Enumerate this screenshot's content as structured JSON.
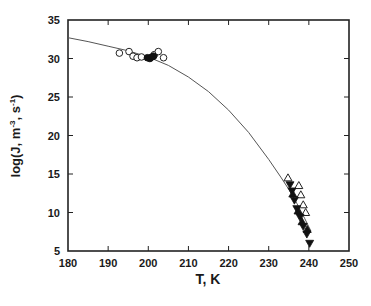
{
  "chart_data": {
    "type": "scatter",
    "title": "",
    "xlabel": "T, K",
    "ylabel": "log(J, m⁻³, s⁻¹)",
    "ylabel_parts": {
      "base": "log(J, m",
      "exp1": "-3",
      "mid": ", s",
      "exp2": "-1",
      "end": ")"
    },
    "xlim": [
      180,
      250
    ],
    "ylim": [
      5,
      35
    ],
    "xticks": [
      180,
      190,
      200,
      210,
      220,
      230,
      240,
      250
    ],
    "yticks": [
      5,
      10,
      15,
      20,
      25,
      30,
      35
    ],
    "grid": false,
    "legend": "none",
    "series": [
      {
        "name": "open circles",
        "marker": "circle-open",
        "points": [
          [
            192.8,
            30.7
          ],
          [
            195.2,
            30.9
          ],
          [
            196.2,
            30.3
          ],
          [
            197.2,
            30.1
          ],
          [
            198.3,
            30.2
          ],
          [
            201.5,
            30.5
          ],
          [
            202.5,
            30.9
          ],
          [
            203.8,
            30.1
          ]
        ]
      },
      {
        "name": "filled circles",
        "marker": "circle-filled",
        "points": [
          [
            199.8,
            30.1
          ],
          [
            200.4,
            30.0
          ],
          [
            200.9,
            30.2
          ],
          [
            201.3,
            30.3
          ]
        ]
      },
      {
        "name": "open triangles",
        "marker": "triangle-up-open",
        "points": [
          [
            234.8,
            14.5
          ],
          [
            237.5,
            13.5
          ],
          [
            238.0,
            12.3
          ],
          [
            238.6,
            11.0
          ],
          [
            239.2,
            10.0
          ]
        ]
      },
      {
        "name": "filled down triangles",
        "marker": "triangle-down-filled",
        "points": [
          [
            235.3,
            13.6
          ],
          [
            235.8,
            12.8
          ],
          [
            236.4,
            11.6
          ],
          [
            237.0,
            10.5
          ],
          [
            237.8,
            9.4
          ],
          [
            238.6,
            8.2
          ],
          [
            239.5,
            7.2
          ],
          [
            240.2,
            6.0
          ]
        ]
      },
      {
        "name": "filled up triangles",
        "marker": "triangle-up-filled",
        "points": [
          [
            236.0,
            12.4
          ],
          [
            237.3,
            10.2
          ],
          [
            238.3,
            8.8
          ],
          [
            239.6,
            7.8
          ]
        ]
      }
    ],
    "fit_curve": {
      "name": "model fit",
      "points": [
        [
          180,
          32.7
        ],
        [
          185,
          32.2
        ],
        [
          190,
          31.6
        ],
        [
          195,
          31.0
        ],
        [
          200,
          30.2
        ],
        [
          205,
          29.1
        ],
        [
          210,
          27.6
        ],
        [
          215,
          25.7
        ],
        [
          220,
          23.3
        ],
        [
          225,
          20.4
        ],
        [
          230,
          16.9
        ],
        [
          233,
          14.6
        ],
        [
          235,
          13.0
        ],
        [
          237,
          11.2
        ],
        [
          239,
          9.2
        ],
        [
          240.5,
          7.6
        ]
      ]
    }
  }
}
